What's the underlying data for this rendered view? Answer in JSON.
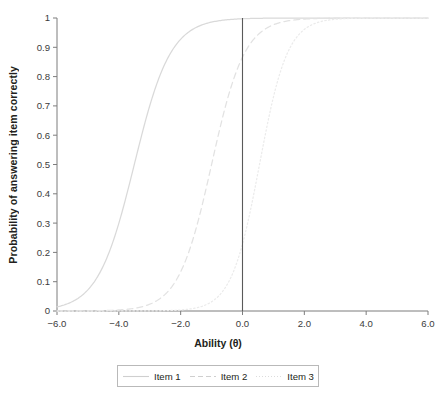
{
  "chart_data": {
    "type": "line",
    "title": "",
    "xlabel": "Ability (θ)",
    "ylabel": "Probability of answering item correctly",
    "xlim": [
      -6.0,
      6.0
    ],
    "ylim": [
      0,
      1
    ],
    "grid": false,
    "legend_position": "bottom",
    "xticks": [
      "−6.0",
      "−4.0",
      "−2.0",
      "0.0",
      "2.0",
      "4.0",
      "6.0"
    ],
    "xtick_values": [
      -6,
      -4,
      -2,
      0,
      2,
      4,
      6
    ],
    "yticks": [
      "0",
      "0.1",
      "0.2",
      "0.3",
      "0.4",
      "0.5",
      "0.6",
      "0.7",
      "0.8",
      "0.9",
      "1"
    ],
    "ytick_values": [
      0,
      0.1,
      0.2,
      0.3,
      0.4,
      0.5,
      0.6,
      0.7,
      0.8,
      0.9,
      1
    ],
    "x": [
      -6,
      -5.5,
      -5,
      -4.5,
      -4,
      -3.5,
      -3,
      -2.5,
      -2,
      -1.5,
      -1,
      -0.5,
      0,
      0.5,
      1,
      1.5,
      2,
      2.5,
      3,
      3.5,
      4,
      4.5,
      5,
      5.5,
      6
    ],
    "series": [
      {
        "name": "Item 1",
        "style": "solid",
        "color": "#d9d9d9",
        "difficulty": -3.5,
        "discrimination": 1.0,
        "values": [
          0.03,
          0.05,
          0.08,
          0.12,
          0.19,
          0.3,
          0.44,
          0.6,
          0.73,
          0.83,
          0.9,
          0.94,
          0.97,
          0.98,
          0.99,
          0.99,
          1.0,
          1.0,
          1.0,
          1.0,
          1.0,
          1.0,
          1.0,
          1.0,
          1.0
        ]
      },
      {
        "name": "Item 2",
        "style": "dashed",
        "color": "#e2e2e2",
        "difficulty": -1.0,
        "discrimination": 1.1,
        "values": [
          0.0,
          0.01,
          0.01,
          0.02,
          0.03,
          0.05,
          0.08,
          0.13,
          0.21,
          0.32,
          0.46,
          0.61,
          0.85,
          0.9,
          0.94,
          0.96,
          0.98,
          0.99,
          0.99,
          1.0,
          1.0,
          1.0,
          1.0,
          1.0,
          1.0
        ]
      },
      {
        "name": "Item 3",
        "style": "dotted",
        "color": "#ebebeb",
        "difficulty": 0.55,
        "discrimination": 1.3,
        "values": [
          0.0,
          0.0,
          0.0,
          0.0,
          0.0,
          0.01,
          0.01,
          0.02,
          0.04,
          0.06,
          0.1,
          0.18,
          0.3,
          0.46,
          0.63,
          0.77,
          0.87,
          0.93,
          0.96,
          0.98,
          0.99,
          0.99,
          1.0,
          1.0,
          1.0
        ]
      }
    ],
    "annotations": [
      {
        "name": "reference-line-theta-zero",
        "type": "vline",
        "x": 0,
        "y_from": 0,
        "y_to": 1,
        "color": "#5a5a5a"
      }
    ]
  },
  "legend": {
    "entries": [
      {
        "label": "Item 1"
      },
      {
        "label": "Item 2"
      },
      {
        "label": "Item 3"
      }
    ]
  },
  "caption": {
    "text": ""
  }
}
